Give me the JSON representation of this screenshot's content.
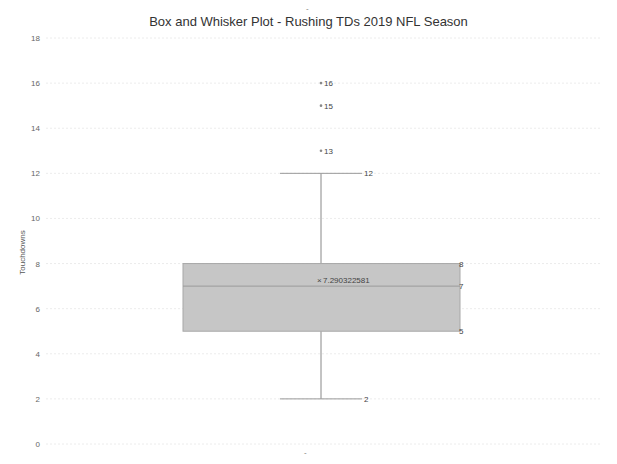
{
  "chart_data": {
    "type": "box",
    "title": "Box and Whisker Plot - Rushing TDs 2019 NFL Season",
    "xlabel": "",
    "ylabel": "Touchdowns",
    "ylim": [
      0,
      18
    ],
    "yticks": [
      0,
      2,
      4,
      6,
      8,
      10,
      12,
      14,
      16,
      18
    ],
    "grid": true,
    "series": [
      {
        "name": "Rushing TDs",
        "min": 2,
        "q1": 5,
        "median": 7,
        "q3": 8,
        "max": 12,
        "mean": 7.290322581,
        "outliers": [
          13,
          15,
          16
        ]
      }
    ],
    "labels": {
      "min": "2",
      "q1": "5",
      "median": "7",
      "q3": "8",
      "max": "12",
      "mean": "7.290322581",
      "outliers": [
        "13",
        "15",
        "16"
      ]
    }
  },
  "chart": {
    "title": "Box and Whisker Plot - Rushing TDs 2019 NFL Season",
    "ylabel": "Touchdowns",
    "top_mark": "-",
    "bottom_mark": "-"
  }
}
